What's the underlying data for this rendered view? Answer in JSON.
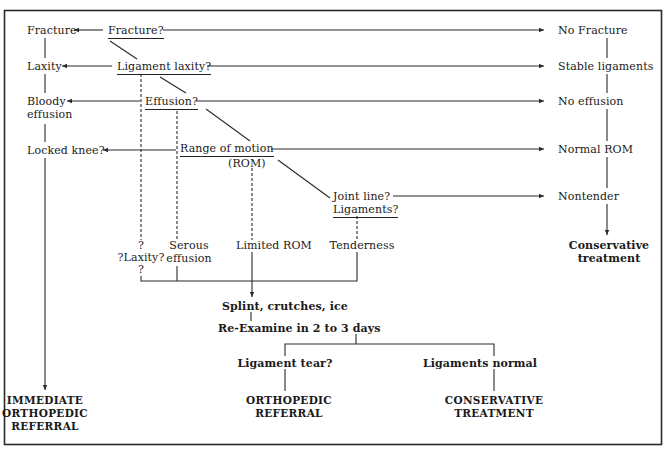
{
  "diagram": {
    "type": "flowchart",
    "nodes": {
      "fracture_q": "Fracture?",
      "fracture": "Fracture",
      "no_fracture": "No Fracture",
      "ligament_laxity_q": "Ligament laxity?",
      "laxity": "Laxity",
      "stable_ligaments": "Stable ligaments",
      "effusion_q": "Effusion?",
      "bloody_effusion_1": "Bloody",
      "bloody_effusion_2": "effusion",
      "no_effusion": "No effusion",
      "rom_q_1": "Range of motion",
      "rom_q_2": "(ROM)",
      "locked_knee": "Locked knee?",
      "normal_rom": "Normal ROM",
      "joint_line_q_1": "Joint line?",
      "joint_line_q_2": "Ligaments?",
      "nontender": "Nontender",
      "conservative_treatment_1": "Conservative",
      "conservative_treatment_2": "treatment",
      "laxity_uncertain_1": "?",
      "laxity_uncertain_2": "?Laxity?",
      "laxity_uncertain_3": "?",
      "serous_effusion_1": "Serous",
      "serous_effusion_2": "effusion",
      "limited_rom": "Limited ROM",
      "tenderness": "Tenderness",
      "splint": "Splint, crutches, ice",
      "reexamine": "Re-Examine in 2 to 3 days",
      "ligament_tear_q": "Ligament tear?",
      "ligaments_normal": "Ligaments normal",
      "immediate_referral_1": "IMMEDIATE",
      "immediate_referral_2": "ORTHOPEDIC",
      "immediate_referral_3": "REFERRAL",
      "ortho_referral_1": "ORTHOPEDIC",
      "ortho_referral_2": "REFERRAL",
      "conservative_final_1": "CONSERVATIVE",
      "conservative_final_2": "TREATMENT"
    },
    "edges": [
      {
        "from": "Fracture?",
        "to": "Fracture",
        "style": "solid-arrow"
      },
      {
        "from": "Fracture?",
        "to": "No Fracture",
        "style": "solid-arrow"
      },
      {
        "from": "Fracture?",
        "to": "Ligament laxity?",
        "style": "solid"
      },
      {
        "from": "Ligament laxity?",
        "to": "Laxity",
        "style": "solid-arrow"
      },
      {
        "from": "Ligament laxity?",
        "to": "Stable ligaments",
        "style": "solid-arrow"
      },
      {
        "from": "Ligament laxity?",
        "to": "Effusion?",
        "style": "solid"
      },
      {
        "from": "Ligament laxity?",
        "to": "?Laxity?",
        "style": "dashed"
      },
      {
        "from": "Effusion?",
        "to": "Bloody effusion",
        "style": "solid-arrow"
      },
      {
        "from": "Effusion?",
        "to": "No effusion",
        "style": "solid-arrow"
      },
      {
        "from": "Effusion?",
        "to": "Range of motion (ROM)",
        "style": "solid"
      },
      {
        "from": "Effusion?",
        "to": "Serous effusion",
        "style": "dashed"
      },
      {
        "from": "Range of motion (ROM)",
        "to": "Locked knee?",
        "style": "solid-arrow"
      },
      {
        "from": "Range of motion (ROM)",
        "to": "Normal ROM",
        "style": "solid-arrow"
      },
      {
        "from": "Range of motion (ROM)",
        "to": "Joint line? Ligaments?",
        "style": "solid"
      },
      {
        "from": "Range of motion (ROM)",
        "to": "Limited ROM",
        "style": "dashed"
      },
      {
        "from": "Joint line? Ligaments?",
        "to": "Nontender",
        "style": "solid-arrow"
      },
      {
        "from": "Joint line? Ligaments?",
        "to": "Tenderness",
        "style": "dashed"
      },
      {
        "from": "No Fracture",
        "to": "Stable ligaments",
        "style": "solid"
      },
      {
        "from": "Stable ligaments",
        "to": "No effusion",
        "style": "solid"
      },
      {
        "from": "No effusion",
        "to": "Normal ROM",
        "style": "solid"
      },
      {
        "from": "Normal ROM",
        "to": "Nontender",
        "style": "solid"
      },
      {
        "from": "Nontender",
        "to": "Conservative treatment",
        "style": "solid-arrow"
      },
      {
        "from": "Fracture",
        "to": "Laxity",
        "style": "solid"
      },
      {
        "from": "Laxity",
        "to": "Bloody effusion",
        "style": "solid"
      },
      {
        "from": "Bloody effusion",
        "to": "Locked knee?",
        "style": "solid"
      },
      {
        "from": "Locked knee?",
        "to": "IMMEDIATE ORTHOPEDIC REFERRAL",
        "style": "solid-arrow"
      },
      {
        "from": "?Laxity? / Serous effusion / Limited ROM / Tenderness",
        "to": "Splint, crutches, ice",
        "style": "bracket-arrow"
      },
      {
        "from": "Splint, crutches, ice",
        "to": "Re-Examine in 2 to 3 days",
        "style": "solid"
      },
      {
        "from": "Re-Examine in 2 to 3 days",
        "to": "Ligament tear?",
        "style": "bracket"
      },
      {
        "from": "Re-Examine in 2 to 3 days",
        "to": "Ligaments normal",
        "style": "bracket"
      },
      {
        "from": "Ligament tear?",
        "to": "ORTHOPEDIC REFERRAL",
        "style": "solid"
      },
      {
        "from": "Ligaments normal",
        "to": "CONSERVATIVE TREATMENT",
        "style": "solid"
      }
    ],
    "colors": {
      "line": "#2a2a2a",
      "text": "#1a1a1a",
      "background": "#ffffff"
    }
  }
}
